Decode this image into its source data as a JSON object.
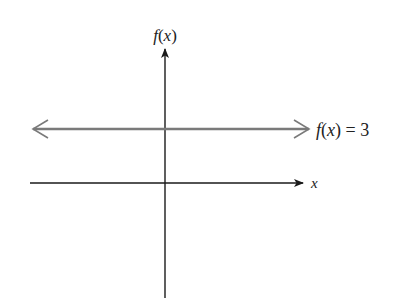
{
  "diagram": {
    "type": "coordinate-plane-constant-function",
    "y_axis_label": "f(x)",
    "x_axis_label": "x",
    "function_label": "f(x) = 3",
    "function_label_parts": {
      "fx": "f(x)",
      "eq": " = 3"
    },
    "colors": {
      "axes": "#1a1a1a",
      "function_line": "#7a7a7a"
    }
  }
}
